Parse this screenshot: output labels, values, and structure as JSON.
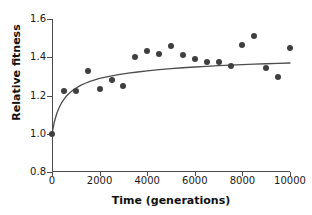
{
  "chart_data": {
    "type": "scatter",
    "title": "",
    "xlabel": "Time (generations)",
    "ylabel": "Relative fitness",
    "xlim": [
      0,
      10000
    ],
    "ylim": [
      0.8,
      1.6
    ],
    "xticks": [
      0,
      2000,
      4000,
      6000,
      8000,
      10000
    ],
    "xtick_labels": [
      "0",
      "2000",
      "4000",
      "6000",
      "8000",
      "10000"
    ],
    "yticks": [
      0.8,
      1.0,
      1.2,
      1.4,
      1.6
    ],
    "ytick_labels": [
      "0.8",
      "1.0",
      "1.2",
      "1.4",
      "1.6"
    ],
    "grid": false,
    "legend": false,
    "point_color": "#3f3f3f",
    "line_color": "#4d4d4d",
    "axis_color": "#4d4d4d",
    "series": [
      {
        "name": "Observed relative fitness",
        "type": "scatter",
        "x": [
          0,
          500,
          1000,
          1500,
          2000,
          2500,
          3000,
          3500,
          4000,
          4500,
          5000,
          5500,
          6000,
          6500,
          7000,
          7500,
          8000,
          8500,
          9000,
          9500,
          10000
        ],
        "y": [
          1.0,
          1.225,
          1.225,
          1.33,
          1.235,
          1.28,
          1.25,
          1.4,
          1.435,
          1.415,
          1.46,
          1.41,
          1.39,
          1.375,
          1.375,
          1.355,
          1.465,
          1.51,
          1.345,
          1.295,
          1.45
        ]
      },
      {
        "name": "Hyperbolic fit",
        "type": "line",
        "x": [
          0,
          100,
          200,
          300,
          400,
          500,
          600,
          700,
          800,
          900,
          1000,
          1200,
          1400,
          1600,
          1800,
          2000,
          2400,
          2800,
          3200,
          3600,
          4000,
          4500,
          5000,
          5500,
          6000,
          6500,
          7000,
          7500,
          8000,
          8500,
          9000,
          9500,
          10000
        ],
        "y": [
          1.0,
          1.063,
          1.106,
          1.137,
          1.161,
          1.18,
          1.196,
          1.209,
          1.22,
          1.23,
          1.238,
          1.253,
          1.264,
          1.274,
          1.282,
          1.289,
          1.3,
          1.309,
          1.317,
          1.323,
          1.329,
          1.335,
          1.34,
          1.345,
          1.349,
          1.352,
          1.356,
          1.359,
          1.361,
          1.364,
          1.366,
          1.368,
          1.37
        ]
      }
    ]
  }
}
